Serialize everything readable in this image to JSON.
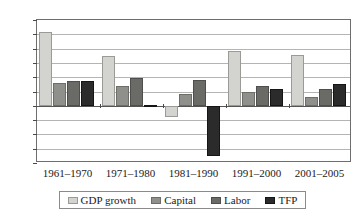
{
  "chart_data": {
    "type": "bar",
    "title": "",
    "subtitle": "",
    "xlabel": "",
    "ylabel": "",
    "grid": true,
    "legend_position": "bottom",
    "categories": [
      "1961–1970",
      "1971–1980",
      "1981–1990",
      "1991–2000",
      "2001–2005"
    ],
    "series": [
      {
        "name": "GDP growth",
        "color": "#d3d3d0",
        "values": [
          5.15,
          3.5,
          -0.8,
          3.8,
          3.55
        ]
      },
      {
        "name": "Capital",
        "color": "#8f8f8c",
        "values": [
          1.6,
          1.4,
          0.85,
          1.0,
          0.65
        ]
      },
      {
        "name": "Labor",
        "color": "#6a6a67",
        "values": [
          1.75,
          1.95,
          1.8,
          1.4,
          1.2
        ]
      },
      {
        "name": "TFP",
        "color": "#2b2b2b",
        "values": [
          1.75,
          0.05,
          -3.5,
          1.2,
          1.55
        ]
      }
    ],
    "ylim": [
      -4,
      6
    ],
    "ytick_values": [
      6,
      5,
      4,
      3,
      2,
      1,
      0,
      -1,
      -2,
      -3,
      -4
    ],
    "ytick_labels": [
      "6%",
      "5%",
      "4%",
      "3%",
      "2%",
      "1%",
      "0%",
      "−1%",
      "−2%",
      "−3%",
      "−4%"
    ],
    "ytick_step": 1
  }
}
